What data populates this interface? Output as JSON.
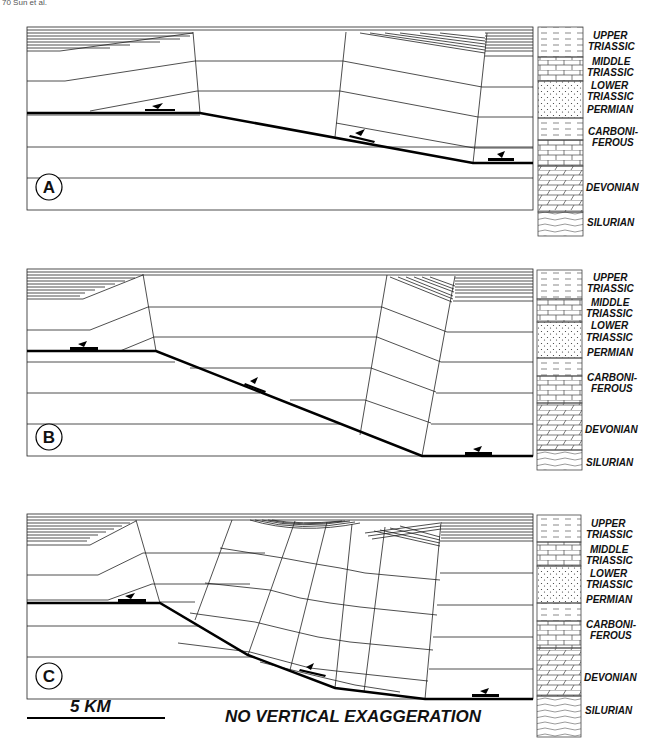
{
  "header": {
    "fragment": "70          Sun et al."
  },
  "panels": [
    {
      "label": "A"
    },
    {
      "label": "B"
    },
    {
      "label": "C"
    }
  ],
  "legend": {
    "units": [
      {
        "line1": "UPPER",
        "line2": "TRIASSIC",
        "pattern": "dashed-shale"
      },
      {
        "line1": "MIDDLE",
        "line2": "TRIASSIC",
        "pattern": "limestone-brick"
      },
      {
        "line1": "LOWER",
        "line2": "TRIASSIC",
        "pattern": "stippled-sandstone"
      },
      {
        "line1": "PERMIAN",
        "line2": "",
        "pattern": "stippled-sandstone"
      },
      {
        "line1": "CARBONI-",
        "line2": "FEROUS",
        "pattern": "shale-over-limestone"
      },
      {
        "line1": "DEVONIAN",
        "line2": "",
        "pattern": "dolomite-slanted-brick"
      },
      {
        "line1": "SILURIAN",
        "line2": "",
        "pattern": "wavy-shale"
      }
    ]
  },
  "footer": {
    "scale_label": "5 KM",
    "note": "NO VERTICAL EXAGGERATION"
  },
  "colors": {
    "line": "#222222",
    "fault": "#000000",
    "background": "#ffffff"
  }
}
